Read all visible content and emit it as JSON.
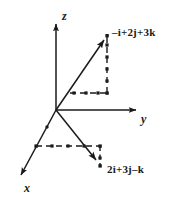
{
  "figure": {
    "background_color": "#ffffff",
    "stroke_color": "#1a1a1a"
  },
  "axes": [
    {
      "name": "z-axis",
      "label": "z",
      "direction": "up",
      "origin": [
        56,
        110
      ],
      "tip": [
        56,
        20
      ]
    },
    {
      "name": "y-axis",
      "label": "y",
      "direction": "right",
      "origin": [
        56,
        110
      ],
      "tip": [
        140,
        110
      ]
    },
    {
      "name": "x-axis",
      "label": "x",
      "direction": "down-left",
      "origin": [
        56,
        110
      ],
      "tip": [
        18,
        180
      ]
    }
  ],
  "vectors": [
    {
      "name": "vector-a",
      "label": "–i+2j+3k",
      "origin": [
        56,
        110
      ],
      "tip": [
        107,
        36
      ],
      "components": {
        "i": -1,
        "j": 2,
        "k": 3
      },
      "projection": {
        "corner": [
          107,
          93
        ],
        "horizontal_start": [
          70,
          93
        ],
        "vertical_start": [
          107,
          36
        ]
      }
    },
    {
      "name": "vector-b",
      "label": "2i+3j–k",
      "origin": [
        56,
        110
      ],
      "tip": [
        99,
        164
      ],
      "components": {
        "i": 2,
        "j": 3,
        "k": -1
      },
      "projection": {
        "corner": [
          100,
          146
        ],
        "horizontal_start": [
          36,
          146
        ],
        "vertical_end": [
          100,
          166
        ]
      }
    }
  ],
  "markers": {
    "vector_a_dashed_dots": [
      [
        74,
        93
      ],
      [
        86,
        93
      ],
      [
        98,
        93
      ],
      [
        107,
        93
      ],
      [
        107,
        80
      ],
      [
        107,
        67
      ],
      [
        107,
        54
      ],
      [
        107,
        42
      ]
    ],
    "vector_b_dashed_dots": [
      [
        36,
        146
      ],
      [
        52,
        146
      ],
      [
        68,
        146
      ],
      [
        84,
        146
      ],
      [
        100,
        146
      ],
      [
        100,
        157
      ],
      [
        100,
        166
      ]
    ],
    "axis_dots": [
      [
        47,
        133
      ]
    ]
  }
}
